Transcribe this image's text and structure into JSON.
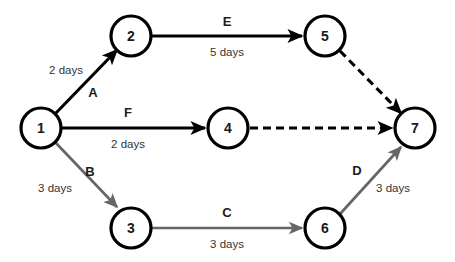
{
  "diagram": {
    "type": "activity-on-arrow-network",
    "canvas": {
      "width": 455,
      "height": 262,
      "background": "#ffffff"
    },
    "colors": {
      "node_stroke": "#000000",
      "node_fill": "#ffffff",
      "edge_black": "#000000",
      "edge_gray": "#666666",
      "text": "#1a1a1a",
      "duration_text": "#333333"
    },
    "nodes": [
      {
        "id": "n1",
        "label": "1",
        "cx": 41,
        "cy": 128,
        "r": 20
      },
      {
        "id": "n2",
        "label": "2",
        "cx": 131,
        "cy": 36,
        "r": 20
      },
      {
        "id": "n3",
        "label": "3",
        "cx": 131,
        "cy": 228,
        "r": 20
      },
      {
        "id": "n4",
        "label": "4",
        "cx": 228,
        "cy": 128,
        "r": 20
      },
      {
        "id": "n5",
        "label": "5",
        "cx": 325,
        "cy": 36,
        "r": 20
      },
      {
        "id": "n6",
        "label": "6",
        "cx": 325,
        "cy": 228,
        "r": 20
      },
      {
        "id": "n7",
        "label": "7",
        "cx": 415,
        "cy": 128,
        "r": 20
      }
    ],
    "edges": [
      {
        "id": "eA",
        "code": "A",
        "duration": "2 days",
        "from": "1",
        "to": "2",
        "style": "solid",
        "color": "black",
        "x1": 55,
        "y1": 114,
        "x2": 117,
        "y2": 50,
        "code_x": 93,
        "code_y": 92,
        "duration_x": 66,
        "duration_y": 70
      },
      {
        "id": "eB",
        "code": "B",
        "duration": "3 days",
        "from": "1",
        "to": "3",
        "style": "solid",
        "color": "gray",
        "x1": 55,
        "y1": 142,
        "x2": 117,
        "y2": 207,
        "code_x": 90,
        "code_y": 171,
        "duration_x": 55,
        "duration_y": 188
      },
      {
        "id": "eF",
        "code": "F",
        "duration": "2 days",
        "from": "1",
        "to": "4",
        "style": "solid",
        "color": "black",
        "x1": 62,
        "y1": 128,
        "x2": 205,
        "y2": 128,
        "code_x": 128,
        "code_y": 112,
        "duration_x": 128,
        "duration_y": 144
      },
      {
        "id": "eE",
        "code": "E",
        "duration": "5 days",
        "from": "2",
        "to": "5",
        "style": "solid",
        "color": "black",
        "x1": 152,
        "y1": 36,
        "x2": 302,
        "y2": 36,
        "code_x": 227,
        "code_y": 21,
        "duration_x": 227,
        "duration_y": 52
      },
      {
        "id": "eC",
        "code": "C",
        "duration": "3 days",
        "from": "3",
        "to": "6",
        "style": "solid",
        "color": "gray",
        "x1": 152,
        "y1": 228,
        "x2": 302,
        "y2": 228,
        "code_x": 227,
        "code_y": 212,
        "duration_x": 227,
        "duration_y": 244
      },
      {
        "id": "eD",
        "code": "D",
        "duration": "3 days",
        "from": "6",
        "to": "7",
        "style": "solid",
        "color": "gray",
        "x1": 340,
        "y1": 214,
        "x2": 401,
        "y2": 147,
        "code_x": 357,
        "code_y": 170,
        "duration_x": 393,
        "duration_y": 188
      },
      {
        "id": "eDummy57",
        "code": "",
        "duration": "",
        "from": "5",
        "to": "7",
        "style": "dashed",
        "color": "black",
        "x1": 340,
        "y1": 51,
        "x2": 401,
        "y2": 113,
        "code_x": 0,
        "code_y": 0,
        "duration_x": 0,
        "duration_y": 0
      },
      {
        "id": "eDummy47",
        "code": "",
        "duration": "",
        "from": "4",
        "to": "7",
        "style": "dashed",
        "color": "black",
        "x1": 250,
        "y1": 128,
        "x2": 392,
        "y2": 128,
        "code_x": 0,
        "code_y": 0,
        "duration_x": 0,
        "duration_y": 0
      }
    ]
  }
}
